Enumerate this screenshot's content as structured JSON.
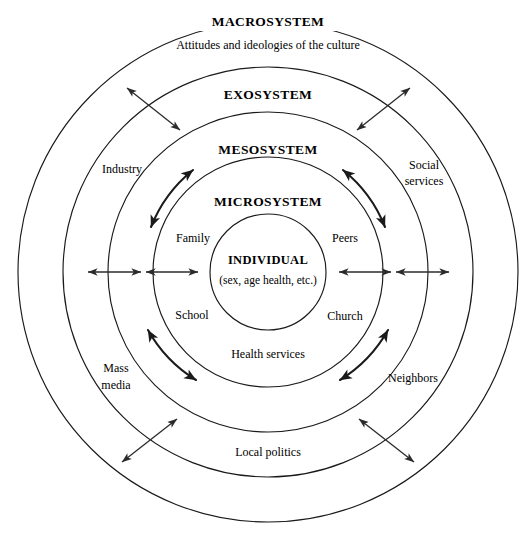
{
  "diagram": {
    "background_color": "#ffffff",
    "line_color": "#1a1a1a",
    "arrow_color": "#2b2b2b",
    "center": {
      "x": 268,
      "y": 272
    }
  },
  "rings": [
    {
      "key": "macrosystem",
      "label": "MACROSYSTEM",
      "radius": 250,
      "label_y": 22
    },
    {
      "key": "exosystem",
      "label": "EXOSYSTEM",
      "radius": 205,
      "label_y": 95
    },
    {
      "key": "mesosystem",
      "label": "MESOSYSTEM",
      "radius": 160,
      "label_y": 150
    },
    {
      "key": "microsystem",
      "label": "MICROSYSTEM",
      "radius": 115,
      "label_y": 202
    },
    {
      "key": "individual",
      "label": "INDIVIDUAL",
      "radius": 58,
      "label_y": 261
    }
  ],
  "labels": {
    "macrosystem_title": "MACROSYSTEM",
    "macrosystem_subtitle": "Attitudes and ideologies of the culture",
    "exosystem_title": "EXOSYSTEM",
    "mesosystem_title": "MESOSYSTEM",
    "microsystem_title": "MICROSYSTEM",
    "individual_title": "INDIVIDUAL",
    "individual_subtitle": "(sex, age health, etc.)",
    "family": "Family",
    "peers": "Peers",
    "school": "School",
    "church": "Church",
    "health_services": "Health services",
    "industry": "Industry",
    "social_services_line1": "Social",
    "social_services_line2": "services",
    "mass_media_line1": "Mass",
    "mass_media_line2": "media",
    "neighbors": "Neighbors",
    "local_politics": "Local politics"
  },
  "arrows": {
    "count_straight_diagonal": 4,
    "count_straight_horizontal": 4,
    "count_curved": 4,
    "style": "double-headed"
  }
}
